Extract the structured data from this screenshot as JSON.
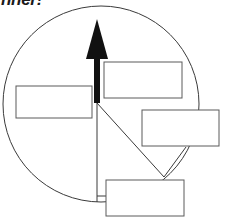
{
  "document": {
    "title_partial": "nner!",
    "title_note": "top line of heading is cropped by the top edge of the image"
  },
  "diagram": {
    "type": "labeled-callout-circle",
    "canvas": {
      "width": 232,
      "height": 221,
      "background": "#ffffff"
    },
    "colors": {
      "outline": "#3a3a3a",
      "arrow": "#111111",
      "box_border": "#5a5a5a",
      "box_fill": "#ffffff",
      "leader": "#3a3a3a",
      "title": "#1a1a1a"
    },
    "circle": {
      "name": "main-circle",
      "cx": 101,
      "cy": 104,
      "r": 98,
      "stroke_width": 1
    },
    "arrow": {
      "name": "up-arrow",
      "direction": "up",
      "tail_x": 97,
      "tail_y": 103,
      "head_y": 19,
      "shaft_width": 6,
      "head_width": 22,
      "head_height": 40
    },
    "radius_lines": [
      {
        "name": "radius-line-vertical-down",
        "x1": 97,
        "y1": 103,
        "x2": 97,
        "y2": 202
      },
      {
        "name": "radius-line-diagonal",
        "x1": 97,
        "y1": 103,
        "x2": 164,
        "y2": 177
      }
    ],
    "leaders": [
      {
        "name": "leader-to-right-box",
        "x1": 164,
        "y1": 177,
        "x2": 186,
        "y2": 147
      },
      {
        "name": "leader-to-bottom-box",
        "x1": 97,
        "y1": 196,
        "x2": 106,
        "y2": 196
      }
    ],
    "callout_boxes": [
      {
        "name": "callout-box-top-right",
        "label": "",
        "x": 104,
        "y": 62,
        "width": 78,
        "height": 36
      },
      {
        "name": "callout-box-left",
        "label": "",
        "x": 16,
        "y": 86,
        "width": 76,
        "height": 32
      },
      {
        "name": "callout-box-right",
        "label": "",
        "x": 142,
        "y": 110,
        "width": 77,
        "height": 36
      },
      {
        "name": "callout-box-bottom",
        "label": "",
        "x": 106,
        "y": 180,
        "width": 78,
        "height": 36
      }
    ]
  }
}
